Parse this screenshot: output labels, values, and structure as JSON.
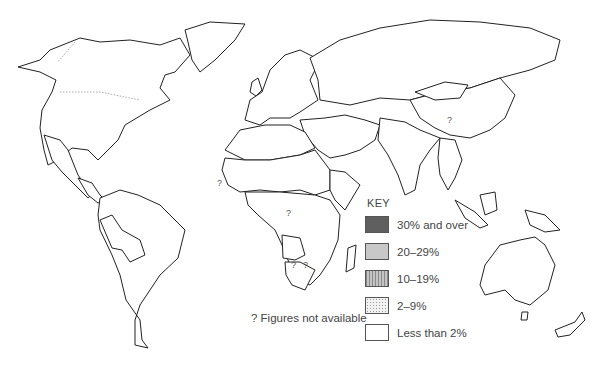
{
  "map": {
    "type": "choropleth world map",
    "key": {
      "title": "KEY",
      "items": [
        {
          "label": "30% and over",
          "fill": "#5f5f5f",
          "pattern": "solid-dark"
        },
        {
          "label": "20–29%",
          "fill": "#c8c8c8",
          "pattern": "solid-light"
        },
        {
          "label": "10–19%",
          "fill": "#b4b4b4",
          "pattern": "vertical-hatch"
        },
        {
          "label": "2–9%",
          "fill": "#e6e6e6",
          "pattern": "dotted"
        },
        {
          "label": "Less than 2%",
          "fill": "#ffffff",
          "pattern": "none"
        }
      ]
    },
    "note": "? Figures not available",
    "unavailable_marker": "?",
    "regions": {
      "north_america": "Less than 2%",
      "mexico": "2–9%",
      "central_america": "20–29%",
      "south_america": "2–9%",
      "peru_bolivia": "20–29%",
      "europe": "Less than 2%",
      "ussr": "Less than 2%",
      "north_africa": "10–19%",
      "sahel_west_africa": "30% and over",
      "ethiopia_sudan": "30% and over",
      "angola": "30% and over",
      "central_east_africa": "20–29%",
      "middle_east": "10–19%",
      "south_asia": "10–19%",
      "china": "?",
      "mongolia": "2–9%",
      "southeast_asia": "20–29%",
      "indonesia": "20–29%",
      "australia": "Less than 2%",
      "new_zealand": "Less than 2%"
    }
  }
}
